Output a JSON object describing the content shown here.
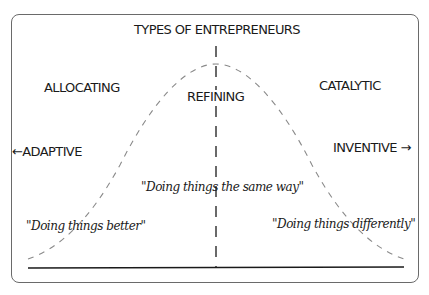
{
  "diagram": {
    "title": "TYPES OF ENTREPRENEURS",
    "categories": {
      "left": "ALLOCATING",
      "center": "REFINING",
      "right": "CATALYTIC"
    },
    "axis": {
      "left_label": "←ADAPTIVE",
      "right_label": "INVENTIVE →"
    },
    "quotes": {
      "left": "\"Doing things better\"",
      "center": "\"Doing things the same way\"",
      "right": "\"Doing things differently\""
    },
    "shape": "bell-curve (dashed) with dashed center line and solid baseline",
    "colors": {
      "curve": "#8a8a8a",
      "center_line": "#1a1a1a",
      "baseline": "#1a1a1a",
      "frame": "#6a6a6a",
      "text": "#1a1a1a"
    }
  }
}
